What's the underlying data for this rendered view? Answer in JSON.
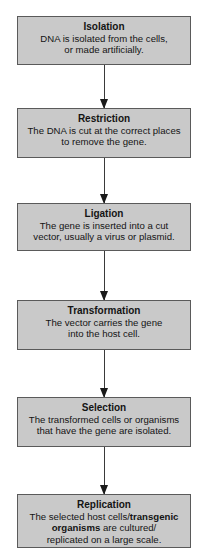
{
  "diagram": {
    "type": "flowchart",
    "steps": [
      {
        "title": "Isolation",
        "lines": [
          "DNA is isolated from the cells,",
          "or made artificially."
        ]
      },
      {
        "title": "Restriction",
        "lines": [
          "The DNA is cut at the correct places",
          "to remove the gene."
        ]
      },
      {
        "title": "Ligation",
        "lines": [
          "The gene is inserted into a cut",
          "vector, usually a virus or plasmid."
        ]
      },
      {
        "title": "Transformation",
        "lines": [
          "The vector carries the gene",
          "into the host cell."
        ]
      },
      {
        "title": "Selection",
        "lines": [
          "The transformed cells or organisms",
          "that have the gene are isolated."
        ]
      },
      {
        "title": "Replication",
        "line1_pre": "The selected host cells/",
        "line1_bold": "transgenic",
        "line2_bold": "organisms",
        "line2_post": " are cultured/",
        "line3": "replicated on a large scale."
      }
    ],
    "colors": {
      "box_fill": "#c9c9c9",
      "box_border": "#5a5a5a",
      "arrow": "#1a1a1a",
      "text": "#141414"
    }
  }
}
